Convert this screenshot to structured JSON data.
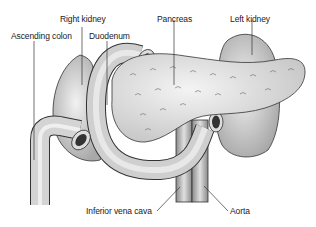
{
  "diagram": {
    "title": "",
    "labels": {
      "right_kidney": "Right kidney",
      "ascending_colon": "Ascending colon",
      "duodenum": "Duodenum",
      "pancreas": "Pancreas",
      "left_kidney": "Left kidney",
      "inferior_vena_cava": "Inferior vena cava",
      "aorta": "Aorta"
    },
    "colors": {
      "organ_fill": "#d9d9d9",
      "organ_dark": "#9a9a9a",
      "outline": "#333333",
      "leader_line": "#333333"
    }
  }
}
